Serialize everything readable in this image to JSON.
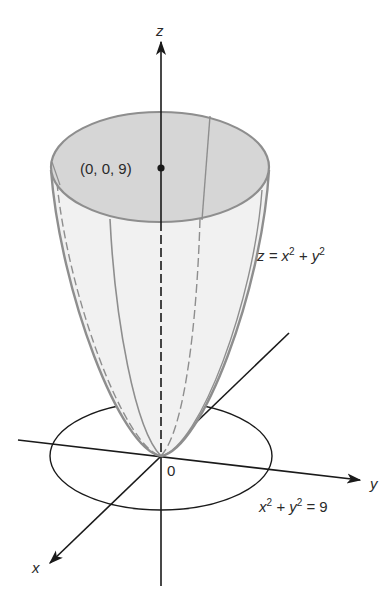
{
  "figure": {
    "colors": {
      "axis": "#1a1a1a",
      "surface_fill": "#f1f1f1",
      "rim_fill": "#d6d6d6",
      "surface_line": "#8e8e8e",
      "text": "#2a2a2a"
    },
    "axes": {
      "x_label": "x",
      "y_label": "y",
      "z_label": "z",
      "origin_label": "0"
    },
    "labels": {
      "top_point": "(0, 0, 9)",
      "surface_eq_main": "z = x",
      "surface_eq_sup1": "2",
      "surface_eq_plus": " + y",
      "surface_eq_sup2": "2",
      "circle_eq_x": "x",
      "circle_eq_sup1": "2",
      "circle_eq_plus": " + y",
      "circle_eq_sup2": "2",
      "circle_eq_rhs": " = 9"
    }
  }
}
